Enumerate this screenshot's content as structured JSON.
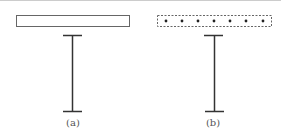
{
  "diagram": {
    "panels": [
      {
        "id": "a",
        "label": "(a)",
        "plate_style": "solid",
        "plate": {
          "x": 16,
          "y": 15,
          "w": 113,
          "h": 11
        },
        "beam": {
          "x": 72,
          "y_top": 35,
          "y_bottom": 111,
          "flange_half": 9
        }
      },
      {
        "id": "b",
        "label": "(b)",
        "plate_style": "dashed-with-dots",
        "plate": {
          "x": 157,
          "y": 15,
          "w": 114,
          "h": 11
        },
        "dots_count": 7,
        "beam": {
          "x": 214,
          "y_top": 35,
          "y_bottom": 111,
          "flange_half": 9
        }
      }
    ],
    "colors": {
      "line": "#333333",
      "plate_border": "#666666",
      "top_rule": "#cccccc",
      "label": "#555555"
    }
  }
}
